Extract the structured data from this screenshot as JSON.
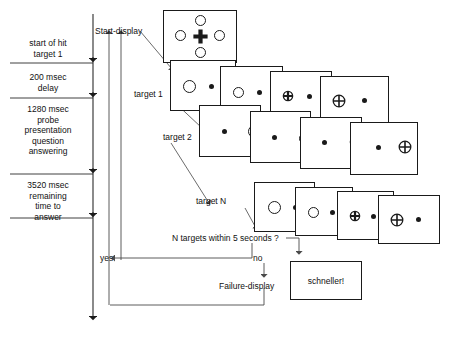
{
  "diagram": {
    "stroke_color": "#1a1a1a",
    "background": "#ffffff"
  },
  "timeline": {
    "phases": [
      {
        "id": "phase-1",
        "text": "start of hit\ntarget 1"
      },
      {
        "id": "phase-2",
        "text": "200 msec\ndelay"
      },
      {
        "id": "phase-3",
        "text": "1280 msec\nprobe\npresentation\nquestion\nanswering"
      },
      {
        "id": "phase-4",
        "text": "3520 msec\nremaining\ntime to\nanswer"
      }
    ]
  },
  "flow_labels": {
    "start_display": "Start-display",
    "target_1": "target 1",
    "target_2": "target 2",
    "target_n": "target N",
    "decision": "N targets within 5 seconds ?",
    "yes": "yes",
    "no": "no",
    "failure_display": "Failure-display"
  },
  "feedback": {
    "message": "schneller!"
  },
  "start_display": {
    "name": "start-display-screen",
    "fixation_icon": "plus-cross-icon",
    "ring_count": 4,
    "ring_positions": [
      "top",
      "left",
      "right",
      "bottom"
    ]
  },
  "sequences": [
    {
      "name": "target-1-row",
      "frames": [
        {
          "left_stim": "large-ring",
          "right_stim": "small-dot"
        },
        {
          "left_stim": "medium-ring",
          "right_stim": "small-dot"
        },
        {
          "left_stim": "small-ring-with-cross",
          "right_stim": "small-dot"
        },
        {
          "left_stim": "ring-with-cross",
          "right_stim": "small-dot"
        }
      ]
    },
    {
      "name": "target-2-row",
      "frames": [
        {
          "left_stim": "small-dot",
          "right_stim": "large-ring"
        },
        {
          "left_stim": "small-dot",
          "right_stim": "medium-ring"
        },
        {
          "left_stim": "small-dot",
          "right_stim": "small-ring-with-cross"
        },
        {
          "left_stim": "small-dot",
          "right_stim": "ring-with-cross"
        }
      ]
    },
    {
      "name": "target-n-row",
      "frames": [
        {
          "left_stim": "large-ring",
          "right_stim": "small-dot"
        },
        {
          "left_stim": "medium-ring",
          "right_stim": "small-dot"
        },
        {
          "left_stim": "small-ring-with-cross",
          "right_stim": "small-dot"
        },
        {
          "left_stim": "ring-with-cross",
          "right_stim": "small-dot"
        }
      ]
    }
  ]
}
